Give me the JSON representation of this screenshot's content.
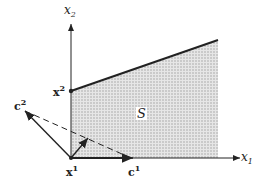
{
  "diagram": {
    "axis_x_label": "x",
    "axis_x_sub": "1",
    "axis_y_label": "x",
    "axis_y_sub": "2",
    "region_label": "S",
    "point_x1_label": "x",
    "point_x1_sup": "1",
    "point_x2_label": "x",
    "point_x2_sup": "2",
    "vector_c1_label": "c",
    "vector_c1_sup": "1",
    "vector_c2_label": "c",
    "vector_c2_sup": "2",
    "colors": {
      "line": "#222222",
      "shade": "#d8d8d8"
    }
  }
}
